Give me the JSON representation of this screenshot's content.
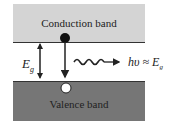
{
  "conduction_band": {
    "label": "Conduction band"
  },
  "valence_band": {
    "label": "Valence band"
  },
  "gap_label": {
    "symbol": "E",
    "subscript": "g"
  },
  "photon_label": {
    "text": "hυ ≈ E",
    "subscript": "g"
  },
  "colors": {
    "conduction": "#d4d4d4",
    "valence": "#767676",
    "line": "#222222"
  }
}
